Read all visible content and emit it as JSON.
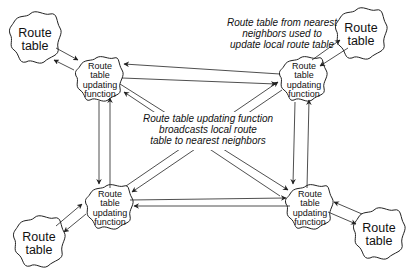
{
  "diagram": {
    "nodes": {
      "route_tables": [
        {
          "id": "rt-top-left",
          "label_lines": [
            "Route",
            "table"
          ]
        },
        {
          "id": "rt-top-right",
          "label_lines": [
            "Route",
            "table"
          ]
        },
        {
          "id": "rt-bottom-left",
          "label_lines": [
            "Route",
            "table"
          ]
        },
        {
          "id": "rt-bottom-right",
          "label_lines": [
            "Route",
            "table"
          ]
        }
      ],
      "functions": [
        {
          "id": "fn-top-left",
          "label_lines": [
            "Route",
            "table",
            "updating",
            "function"
          ]
        },
        {
          "id": "fn-top-right",
          "label_lines": [
            "Route",
            "table",
            "updating",
            "function"
          ]
        },
        {
          "id": "fn-bottom-left",
          "label_lines": [
            "Route",
            "table",
            "updating",
            "function"
          ]
        },
        {
          "id": "fn-bottom-right",
          "label_lines": [
            "Route",
            "table",
            "updating",
            "function"
          ]
        }
      ]
    },
    "annotations": {
      "top_right_note": [
        "Route table from nearest",
        "neighbors used to",
        "update local route table"
      ],
      "center_note": [
        "Route table updating function",
        "broadcasts local route",
        "table to nearest neighbors"
      ]
    },
    "edges": [
      {
        "from": "rt-top-left",
        "to": "fn-top-left",
        "bidirectional": true
      },
      {
        "from": "rt-top-right",
        "to": "fn-top-right",
        "bidirectional": true
      },
      {
        "from": "rt-bottom-left",
        "to": "fn-bottom-left",
        "bidirectional": true
      },
      {
        "from": "rt-bottom-right",
        "to": "fn-bottom-right",
        "bidirectional": true
      },
      {
        "from": "fn-top-left",
        "to": "fn-top-right",
        "bidirectional": true
      },
      {
        "from": "fn-bottom-left",
        "to": "fn-bottom-right",
        "bidirectional": true
      },
      {
        "from": "fn-top-left",
        "to": "fn-bottom-left",
        "bidirectional": true
      },
      {
        "from": "fn-top-right",
        "to": "fn-bottom-right",
        "bidirectional": true
      },
      {
        "from": "fn-top-left",
        "to": "fn-bottom-right",
        "bidirectional": true
      },
      {
        "from": "fn-top-right",
        "to": "fn-bottom-left",
        "bidirectional": true
      }
    ],
    "colors": {
      "stroke": "#222222",
      "background": "#ffffff",
      "text": "#111111"
    }
  }
}
